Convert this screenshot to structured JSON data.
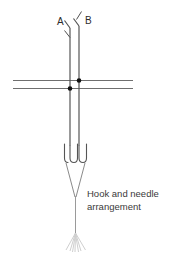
{
  "figure": {
    "title": "Hook and needle arrangement",
    "caption_line_1": "Hook and needle",
    "caption_line_2": "arrangement",
    "labels": {
      "needle_a": "A",
      "needle_b": "B"
    },
    "colors": {
      "line": "#4a4a4a",
      "needle": "#555555",
      "dot": "#111111",
      "horizontal_line": "#7a7a7a",
      "tassel": "#cfcfcf",
      "text": "#3a3a3a",
      "background": "#ffffff"
    },
    "elements": [
      {
        "name": "needle-a",
        "type": "vertical-needle",
        "x": 70,
        "top_y": 26,
        "bottom_y": 160,
        "hook": "barbed-tip"
      },
      {
        "name": "needle-b",
        "type": "vertical-needle",
        "x": 79,
        "top_y": 24,
        "bottom_y": 160,
        "hook": "barbed-tip"
      },
      {
        "name": "tick-mark",
        "type": "short-diagonal-stroke",
        "x1": 76,
        "y1": 19,
        "x2": 81,
        "y2": 12
      },
      {
        "name": "horizontal-line-upper",
        "type": "horizontal-line",
        "x1": 13,
        "x2": 133,
        "y": 80
      },
      {
        "name": "horizontal-line-lower",
        "type": "horizontal-line",
        "x1": 13,
        "x2": 133,
        "y": 88
      },
      {
        "name": "intersection-dot-b",
        "type": "dot",
        "x": 79,
        "y": 80
      },
      {
        "name": "intersection-dot-a",
        "type": "dot",
        "x": 70,
        "y": 88
      },
      {
        "name": "loop-left",
        "type": "u-loop",
        "x": 70,
        "y_top": 143,
        "y_bottom": 162
      },
      {
        "name": "loop-right",
        "type": "u-loop",
        "x": 79,
        "y_top": 143,
        "y_bottom": 162
      },
      {
        "name": "convergence-v",
        "type": "converging-lines",
        "from_x1": 70,
        "from_x2": 79,
        "to_x": 75,
        "y_top": 162,
        "y_bottom": 196
      },
      {
        "name": "tail-line",
        "type": "vertical-line",
        "x": 75,
        "y_top": 196,
        "y_bottom": 233
      },
      {
        "name": "tassel",
        "type": "fanned-brush",
        "x": 75,
        "y_top": 233,
        "y_bottom": 250,
        "spread": 16
      }
    ]
  }
}
